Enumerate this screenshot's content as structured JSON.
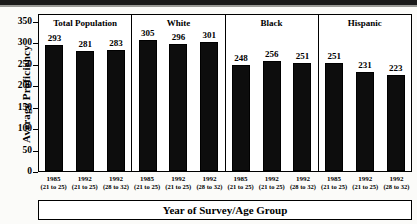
{
  "chart_data": {
    "type": "bar",
    "title": "",
    "xlabel": "Year of Survey/Age Group",
    "ylabel": "Average Proficiency",
    "ylim": [
      0,
      350
    ],
    "yticks": [
      0,
      50,
      100,
      150,
      200,
      250,
      300,
      350
    ],
    "grid": false,
    "legend": "none",
    "bar_color": "#0d0d0d",
    "panels": [
      {
        "name": "Total Population",
        "categories": [
          "1985",
          "1992",
          "1992"
        ],
        "age_groups": [
          "(21 to 25)",
          "(21 to 25)",
          "(28 to 32)"
        ],
        "values": [
          293,
          281,
          283
        ]
      },
      {
        "name": "White",
        "categories": [
          "1985",
          "1992",
          "1992"
        ],
        "age_groups": [
          "(21 to 25)",
          "(21 to 25)",
          "(28 to 32)"
        ],
        "values": [
          305,
          296,
          301
        ]
      },
      {
        "name": "Black",
        "categories": [
          "1985",
          "1992",
          "1992"
        ],
        "age_groups": [
          "(21 to 25)",
          "(21 to 25)",
          "(28 to 32)"
        ],
        "values": [
          248,
          256,
          251
        ]
      },
      {
        "name": "Hispanic",
        "categories": [
          "1985",
          "1992",
          "1992"
        ],
        "age_groups": [
          "(21 to 25)",
          "(21 to 25)",
          "(28 to 32)"
        ],
        "values": [
          251,
          231,
          223
        ]
      }
    ]
  }
}
